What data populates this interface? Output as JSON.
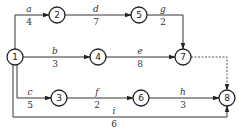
{
  "diagram": {
    "type": "activity-on-arrow network",
    "nodes": [
      {
        "id": "1",
        "label": "1"
      },
      {
        "id": "2",
        "label": "2"
      },
      {
        "id": "3",
        "label": "3"
      },
      {
        "id": "4",
        "label": "4"
      },
      {
        "id": "5",
        "label": "5"
      },
      {
        "id": "6",
        "label": "6"
      },
      {
        "id": "7",
        "label": "7"
      },
      {
        "id": "8",
        "label": "8"
      }
    ],
    "activities": [
      {
        "name": "a",
        "duration": "4",
        "from": "1",
        "to": "2"
      },
      {
        "name": "b",
        "duration": "3",
        "from": "1",
        "to": "4"
      },
      {
        "name": "c",
        "duration": "5",
        "from": "1",
        "to": "3"
      },
      {
        "name": "d",
        "duration": "7",
        "from": "2",
        "to": "5"
      },
      {
        "name": "e",
        "duration": "8",
        "from": "4",
        "to": "7"
      },
      {
        "name": "f",
        "duration": "2",
        "from": "3",
        "to": "6"
      },
      {
        "name": "g",
        "duration": "2",
        "from": "5",
        "to": "7"
      },
      {
        "name": "h",
        "duration": "3",
        "from": "6",
        "to": "8"
      },
      {
        "name": "i",
        "duration": "6",
        "from": "1",
        "to": "8"
      }
    ],
    "dummy_activities": [
      {
        "from": "7",
        "to": "8",
        "style": "dashed"
      }
    ]
  }
}
